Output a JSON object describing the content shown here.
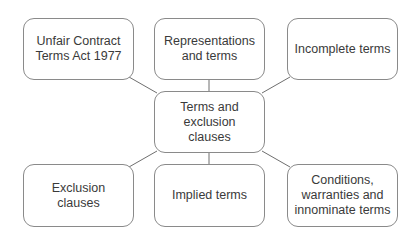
{
  "diagram": {
    "type": "mind-map",
    "center": {
      "id": "center",
      "label": "Terms and\nexclusion clauses",
      "x": 154,
      "y": 91,
      "w": 111,
      "h": 62
    },
    "nodes": [
      {
        "id": "ucta",
        "label": "Unfair Contract\nTerms Act 1977",
        "x": 23,
        "y": 18,
        "w": 111,
        "h": 62
      },
      {
        "id": "reps",
        "label": "Representations\nand terms",
        "x": 154,
        "y": 18,
        "w": 111,
        "h": 62
      },
      {
        "id": "incomplete",
        "label": "Incomplete terms",
        "x": 287,
        "y": 18,
        "w": 111,
        "h": 62
      },
      {
        "id": "exclusion",
        "label": "Exclusion clauses",
        "x": 23,
        "y": 164,
        "w": 111,
        "h": 63
      },
      {
        "id": "implied",
        "label": "Implied terms",
        "x": 154,
        "y": 164,
        "w": 111,
        "h": 63
      },
      {
        "id": "conditions",
        "label": "Conditions,\nwarranties and\ninnominate terms",
        "x": 287,
        "y": 164,
        "w": 111,
        "h": 63
      }
    ],
    "edges": [
      {
        "from": "center",
        "to": "ucta",
        "x1": 157,
        "y1": 93,
        "x2": 129,
        "y2": 77
      },
      {
        "from": "center",
        "to": "reps",
        "x1": 209,
        "y1": 91,
        "x2": 209,
        "y2": 80
      },
      {
        "from": "center",
        "to": "incomplete",
        "x1": 262,
        "y1": 93,
        "x2": 290,
        "y2": 77
      },
      {
        "from": "center",
        "to": "exclusion",
        "x1": 157,
        "y1": 151,
        "x2": 129,
        "y2": 167
      },
      {
        "from": "center",
        "to": "implied",
        "x1": 209,
        "y1": 153,
        "x2": 209,
        "y2": 164
      },
      {
        "from": "center",
        "to": "conditions",
        "x1": 262,
        "y1": 151,
        "x2": 290,
        "y2": 167
      }
    ],
    "colors": {
      "border": "#8a8a8a",
      "line": "#6e6e6e",
      "text": "#3a3a3a"
    }
  }
}
